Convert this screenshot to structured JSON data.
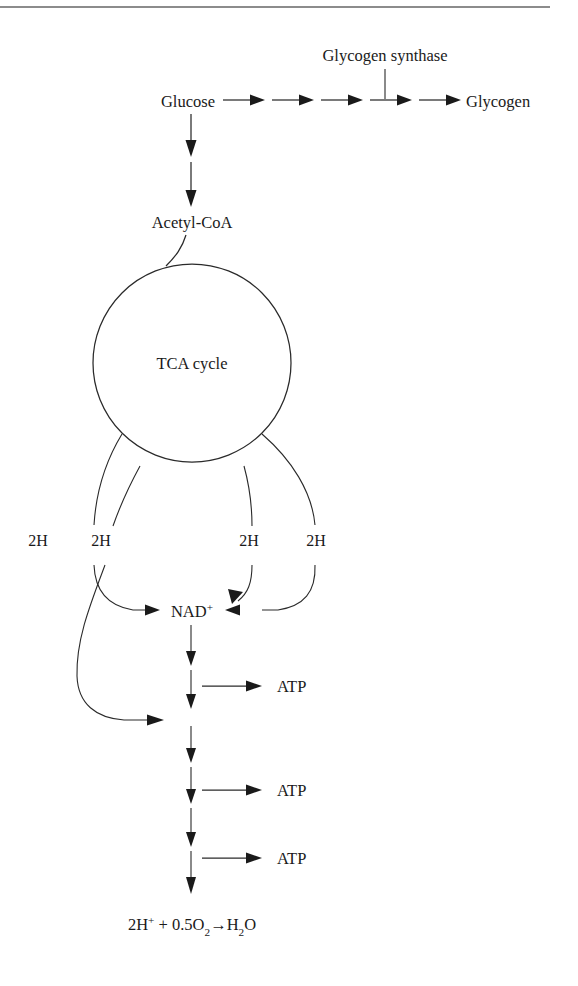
{
  "figure": {
    "has_top_rule": true,
    "line_color": "#2a2a2a",
    "rule_color": "#8c8c8c",
    "background": "#ffffff"
  },
  "nodes": {
    "glucose": "Glucose",
    "glycogen": "Glycogen",
    "glycogen_synthase": "Glycogen synthase",
    "acetyl_coa": "Acetyl-CoA",
    "tca_cycle": "TCA cycle",
    "nad": {
      "base": "NAD",
      "superscript": "+"
    },
    "atp_1": "ATP",
    "atp_2": "ATP",
    "atp_3": "ATP",
    "water_equation": {
      "full_text": "2H+ + 0.5O2 → H2O",
      "part_1_base": "2H",
      "part_1_sup": "+",
      "part_2": " + 0.5O",
      "part_2_sub": "2",
      "arrow": "→",
      "part_3_base": "H",
      "part_3_sub": "2",
      "part_3_tail": "O"
    }
  },
  "hydrogen_carriers": [
    {
      "id": "2h-1",
      "label": "2H"
    },
    {
      "id": "2h-2",
      "label": "2H"
    },
    {
      "id": "2h-3",
      "label": "2H"
    },
    {
      "id": "2h-4",
      "label": "2H"
    }
  ],
  "pathway": {
    "glycogenesis_arrow_count": 5,
    "glucose_to_acetyl_arrow_count": 2,
    "respiratory_chain_arrow_count": 6,
    "atp_branch_count": 3
  }
}
